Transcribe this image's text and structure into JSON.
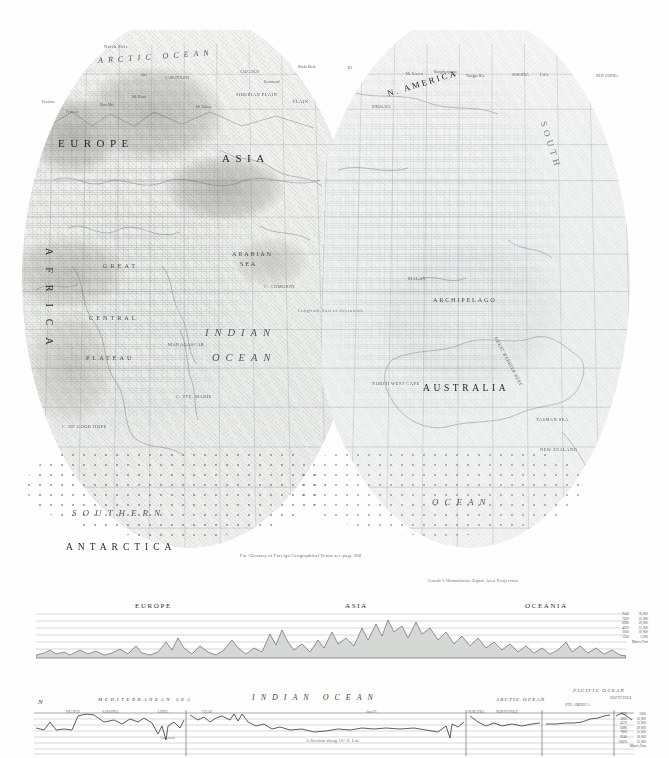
{
  "page": {
    "kind": "atlas-plate",
    "glossary_note": "For Glossary of Foreign Geographical Terms see page 260",
    "projection_note": "Goode's Homolosine Equal Area Projection"
  },
  "map": {
    "continents": [
      {
        "label": "EUROPE",
        "x": 58,
        "y": 137
      },
      {
        "label": "ASIA",
        "x": 222,
        "y": 152
      },
      {
        "label": "AFRICA",
        "x": 44,
        "y": 248
      },
      {
        "label": "AUSTRALIA",
        "x": 423,
        "y": 383
      },
      {
        "label": "ANTARCTICA",
        "x": 66,
        "y": 542
      },
      {
        "label": "N. AMERICA",
        "x": 386,
        "y": 78
      },
      {
        "label": "SOUTH",
        "x": 548,
        "y": 120
      }
    ],
    "oceans": [
      {
        "label": "ARCTIC OCEAN",
        "x": 98,
        "y": 52
      },
      {
        "label": "INDIAN",
        "x": 205,
        "y": 327
      },
      {
        "label": "OCEAN",
        "x": 212,
        "y": 352
      },
      {
        "label": "SOUTHERN",
        "x": 72,
        "y": 508
      },
      {
        "label": "OCEAN",
        "x": 432,
        "y": 497
      },
      {
        "label": "ARABIAN",
        "x": 232,
        "y": 250
      },
      {
        "label": "SEA",
        "x": 240,
        "y": 260
      },
      {
        "label": "ARCHIPELAGO",
        "x": 433,
        "y": 296
      }
    ],
    "regions": [
      {
        "label": "North Pole",
        "x": 104,
        "y": 44
      },
      {
        "label": "SIBERIAN PLAIN",
        "x": 236,
        "y": 92
      },
      {
        "label": "PLAIN",
        "x": 293,
        "y": 99
      },
      {
        "label": "GREAT",
        "x": 103,
        "y": 262
      },
      {
        "label": "CENTRAL",
        "x": 89,
        "y": 314
      },
      {
        "label": "PLATEAU",
        "x": 86,
        "y": 354
      },
      {
        "label": "MADAGASCAR",
        "x": 168,
        "y": 342
      },
      {
        "label": "C. OF GOOD HOPE",
        "x": 62,
        "y": 424
      },
      {
        "label": "C. STE. MARIE",
        "x": 176,
        "y": 394
      },
      {
        "label": "NORTH WEST CAPE",
        "x": 372,
        "y": 381
      },
      {
        "label": "TASMAN SEA",
        "x": 536,
        "y": 417
      },
      {
        "label": "NEW ZEALAND",
        "x": 540,
        "y": 447
      },
      {
        "label": "GREAT BARRIER REEF",
        "x": 498,
        "y": 336
      },
      {
        "label": "C. COMORIN",
        "x": 264,
        "y": 284
      },
      {
        "label": "MALAY",
        "x": 408,
        "y": 276
      },
      {
        "label": "Longitude East of Greenwich",
        "x": 298,
        "y": 308
      }
    ]
  },
  "profile_relief": {
    "title": "Relief profile",
    "sections": [
      {
        "label": "EUROPE",
        "x": 135
      },
      {
        "label": "ASIA",
        "x": 345
      },
      {
        "label": "OCEANIA",
        "x": 525
      }
    ],
    "scale_units": "Meters   Feet",
    "scale": [
      {
        "meters": "9140",
        "feet": "30,000"
      },
      {
        "meters": "7620",
        "feet": "25,000"
      },
      {
        "meters": "6096",
        "feet": "20,000"
      },
      {
        "meters": "4570",
        "feet": "15,000"
      },
      {
        "meters": "3050",
        "feet": "10,000"
      },
      {
        "meters": "1520",
        "feet": "5,000"
      }
    ],
    "points": [
      {
        "label": "Pennines",
        "x": 42,
        "y": 100
      },
      {
        "label": "Harz Mts.",
        "x": 100,
        "y": 103
      },
      {
        "label": "Pyrenees",
        "x": 66,
        "y": 110
      },
      {
        "label": "Alps",
        "x": 140,
        "y": 73
      },
      {
        "label": "Mt. Blanc",
        "x": 132,
        "y": 95
      },
      {
        "label": "CARPATHIANS",
        "x": 165,
        "y": 76
      },
      {
        "label": "Mt. Elbrus",
        "x": 196,
        "y": 105
      },
      {
        "label": "CAUCASUS",
        "x": 240,
        "y": 70
      },
      {
        "label": "Demavend",
        "x": 264,
        "y": 80
      },
      {
        "label": "Hindu Kush",
        "x": 298,
        "y": 65
      },
      {
        "label": "K2",
        "x": 348,
        "y": 66
      },
      {
        "label": "HIMALAYA",
        "x": 372,
        "y": 105
      },
      {
        "label": "Mt. Everest",
        "x": 406,
        "y": 72
      },
      {
        "label": "Kangchenjunga",
        "x": 434,
        "y": 70
      },
      {
        "label": "Tsangpo Riv.",
        "x": 466,
        "y": 74
      },
      {
        "label": "JAVA",
        "x": 540,
        "y": 73
      },
      {
        "label": "NEW GUINEA",
        "x": 596,
        "y": 74
      },
      {
        "label": "SUMATRA",
        "x": 512,
        "y": 73
      }
    ]
  },
  "profile_section": {
    "caption": "A Section along 10° S. Lat.",
    "labels": [
      {
        "label": "N",
        "x": 40,
        "y": 702
      },
      {
        "label": "MEDITERRANEAN SEA",
        "x": 100,
        "y": 700
      },
      {
        "label": "INDIAN      OCEAN",
        "x": 258,
        "y": 698
      },
      {
        "label": "ARCTIC OCEAN",
        "x": 500,
        "y": 700
      },
      {
        "label": "PACIFIC OCEAN",
        "x": 575,
        "y": 689
      },
      {
        "label": "SOUTH POLE",
        "x": 614,
        "y": 697
      },
      {
        "label": "STH. AMERICA",
        "x": 568,
        "y": 703
      }
    ],
    "points": [
      {
        "label": "FRANCE",
        "x": 68,
        "y": 710
      },
      {
        "label": "SARDINIA",
        "x": 104,
        "y": 710
      },
      {
        "label": "LIBYA",
        "x": 160,
        "y": 710
      },
      {
        "label": "CHAD",
        "x": 204,
        "y": 710
      },
      {
        "label": "Java Tr.",
        "x": 368,
        "y": 710
      },
      {
        "label": "SUMATRA",
        "x": 472,
        "y": 710
      },
      {
        "label": "NORTH POLE",
        "x": 498,
        "y": 710
      },
      {
        "label": "Cameroon",
        "x": 162,
        "y": 736
      }
    ],
    "scale_units": "Meters   Feet",
    "scale": [
      {
        "meters": "1520",
        "feet": "5000"
      },
      {
        "meters": "3050",
        "feet": "10,000"
      },
      {
        "meters": "4570",
        "feet": "15,000"
      },
      {
        "meters": "6096",
        "feet": "20,000"
      },
      {
        "meters": "7600",
        "feet": "25,000"
      },
      {
        "meters": "9140",
        "feet": "30,000"
      },
      {
        "meters": "10670",
        "feet": "35,000"
      }
    ]
  }
}
